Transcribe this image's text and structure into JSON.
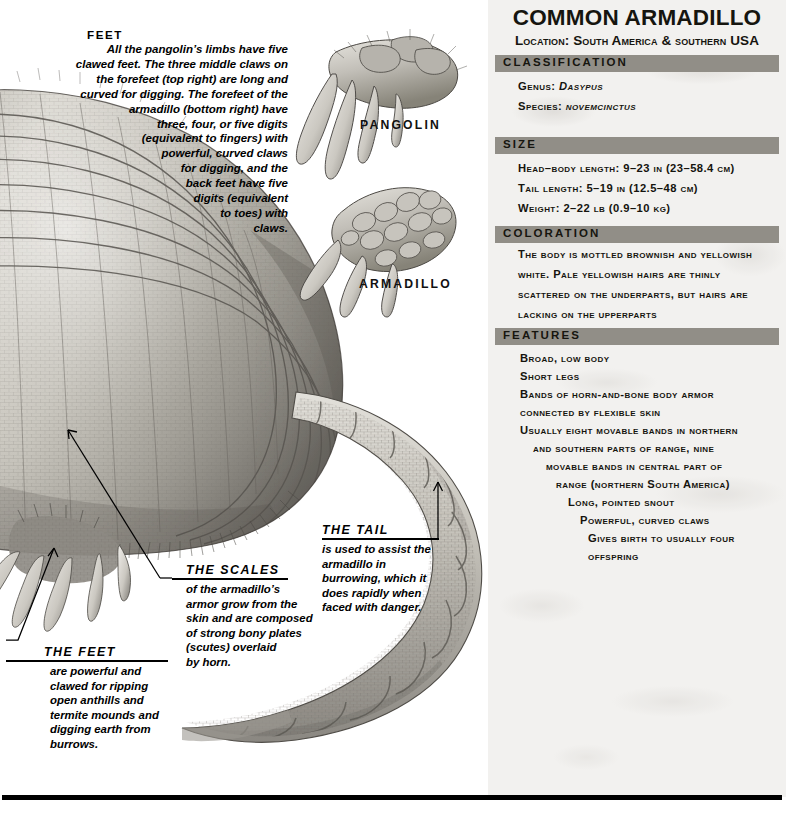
{
  "panel": {
    "title": "COMMON ARMADILLO",
    "subtitle": "Location: South America & southern USA",
    "sections": [
      {
        "header": "CLASSIFICATION",
        "lines": [
          "Genus: Dasypus",
          "Species: novemcinctus"
        ]
      },
      {
        "header": "SIZE",
        "lines": [
          "Head–body length: 9–23 in (23–58.4 cm)",
          "Tail length: 5–19 in (12.5–48 cm)",
          "Weight: 2–22 lb (0.9–10 kg)"
        ]
      },
      {
        "header": "COLORATION",
        "lines": [
          "The body is mottled brownish and yellowish",
          "white. Pale yellowish hairs are thinly",
          "scattered on the underparts, but hairs are",
          "lacking on the upperparts"
        ]
      },
      {
        "header": "FEATURES",
        "lines": [
          "Broad, low body",
          "Short legs",
          "Bands of horn-and-bone body armor",
          "connected by flexible skin",
          "Usually eight movable bands in northern",
          "and southern parts of range, nine",
          "movable bands in central part of",
          "range (northern South America)",
          "Long, pointed snout",
          "Powerful, curved claws",
          "Gives birth to usually four",
          "offspring"
        ]
      }
    ]
  },
  "illustration": {
    "feet_note": {
      "heading": "FEET",
      "lines": [
        "All the pangolin’s limbs have five",
        "clawed feet. The three middle claws on",
        "the forefeet  (top right) are long and",
        "curved for digging. The forefeet of the",
        "armadillo (bottom right) have",
        "three, four, or five digits",
        "(equivalent to fingers) with",
        "powerful, curved claws",
        "for digging, and the",
        "back feet have five",
        "digits (equivalent",
        "to toes) with",
        "claws."
      ]
    },
    "specimen_labels": {
      "pangolin": "PANGOLIN",
      "armadillo": "ARMADILLO"
    },
    "callouts": [
      {
        "heading": "THE SCALES",
        "lines": [
          "of the armadillo’s",
          "armor grow from the",
          "skin and are composed",
          "of strong bony plates",
          "(scutes) overlaid",
          "by horn."
        ]
      },
      {
        "heading": "THE TAIL",
        "lines": [
          "is used to assist the",
          "armadillo in",
          "burrowing, which it",
          "does rapidly when",
          "faced with danger."
        ]
      },
      {
        "heading": "THE FEET",
        "lines": [
          "are powerful and",
          "clawed for ripping",
          "open anthills and",
          "termite mounds and",
          "digging earth from",
          "burrows."
        ]
      }
    ]
  },
  "colors": {
    "section_bar": "#918e87",
    "panel_bg": "#f2f1ef",
    "text": "#16150f",
    "rule": "#000000"
  }
}
